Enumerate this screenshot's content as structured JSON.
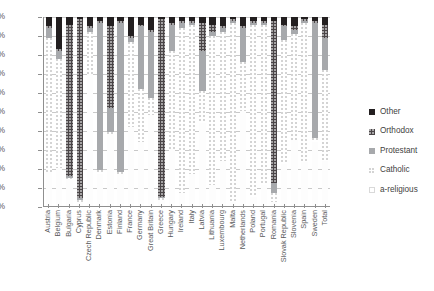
{
  "chart_data": {
    "type": "bar",
    "subtype": "stacked-percentage",
    "title": "",
    "xlabel": "",
    "ylabel": "",
    "ylim": [
      0,
      100
    ],
    "ytick_labels": [
      "100%",
      "90%",
      "80%",
      "70%",
      "60%",
      "50%",
      "40%",
      "30%",
      "20%",
      "10%",
      "0%"
    ],
    "ytick_values": [
      100,
      90,
      80,
      70,
      60,
      50,
      40,
      30,
      20,
      10,
      0
    ],
    "grid": true,
    "grid_axis": "y",
    "legend_position": "right",
    "stack_order_top_to_bottom": [
      "Other",
      "Orthodox",
      "Protestant",
      "Catholic",
      "a-religious"
    ],
    "categories": [
      "Austria",
      "Belgium",
      "Bulgaria",
      "Cyprus",
      "Czech Republic",
      "Denmark",
      "Estonia",
      "Finland",
      "France",
      "Germany",
      "Great Britain",
      "Greece",
      "Hungary",
      "Ireland",
      "Italy",
      "Latvia",
      "Lithuania",
      "Luxembourg",
      "Malta",
      "Netherlands",
      "Poland",
      "Portugal",
      "Romania",
      "Slovak Republic",
      "Slovenia",
      "Spain",
      "Sweden",
      "Total"
    ],
    "series": [
      {
        "name": "a-religious",
        "color": "#ffffff",
        "values": [
          18,
          20,
          14,
          2,
          70,
          17,
          38,
          17,
          42,
          34,
          48,
          3,
          30,
          7,
          17,
          44,
          11,
          24,
          2,
          50,
          5,
          11,
          2,
          22,
          35,
          23,
          34,
          24
        ]
      },
      {
        "name": "Catholic",
        "color": "#ffffff-dots",
        "values": [
          71,
          58,
          1,
          1,
          22,
          2,
          1,
          1,
          45,
          28,
          9,
          1,
          52,
          87,
          79,
          17,
          79,
          68,
          95,
          26,
          91,
          85,
          5,
          66,
          56,
          74,
          2,
          48
        ]
      },
      {
        "name": "Protestant",
        "color": "#a7a9ac",
        "values": [
          5,
          4,
          1,
          1,
          2,
          78,
          13,
          79,
          2,
          33,
          35,
          1,
          14,
          3,
          1,
          21,
          2,
          2,
          1,
          18,
          1,
          1,
          5,
          7,
          2,
          1,
          61,
          17
        ]
      },
      {
        "name": "Orthodox",
        "color": "#4a4547",
        "values": [
          1,
          1,
          80,
          95,
          1,
          1,
          43,
          1,
          1,
          1,
          1,
          94,
          1,
          1,
          1,
          15,
          4,
          1,
          1,
          1,
          1,
          1,
          86,
          1,
          2,
          1,
          1,
          7
        ]
      },
      {
        "name": "Other",
        "color": "#231f20",
        "values": [
          5,
          17,
          4,
          1,
          5,
          2,
          5,
          2,
          10,
          4,
          7,
          1,
          3,
          2,
          2,
          3,
          4,
          5,
          1,
          5,
          2,
          2,
          2,
          4,
          5,
          1,
          2,
          4
        ]
      }
    ]
  },
  "legend": {
    "items": [
      {
        "label": "Other",
        "swatch": "s-other"
      },
      {
        "label": "Orthodox",
        "swatch": "s-orthodox"
      },
      {
        "label": "Protestant",
        "swatch": "s-protestant"
      },
      {
        "label": "Catholic",
        "swatch": "s-catholic"
      },
      {
        "label": "a-religious",
        "swatch": "s-areligious"
      }
    ]
  }
}
